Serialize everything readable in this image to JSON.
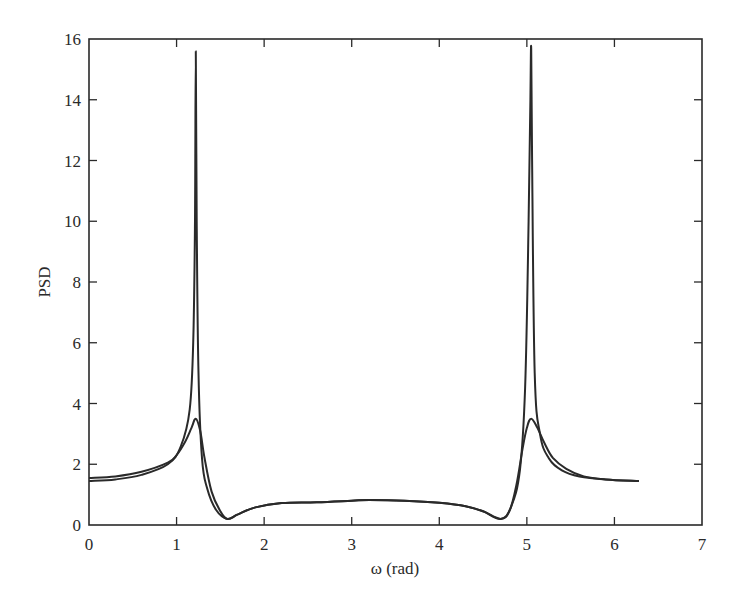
{
  "chart_data": {
    "type": "line",
    "title": "",
    "xlabel": "ω (rad)",
    "ylabel": "PSD",
    "xlim": [
      0,
      7
    ],
    "ylim": [
      0,
      16
    ],
    "xticks": [
      0,
      1,
      2,
      3,
      4,
      5,
      6,
      7
    ],
    "yticks": [
      0,
      2,
      4,
      6,
      8,
      10,
      12,
      14,
      16
    ],
    "xtick_labels": [
      "0",
      "1",
      "2",
      "3",
      "4",
      "5",
      "6",
      "7"
    ],
    "ytick_labels": [
      "0",
      "2",
      "4",
      "6",
      "8",
      "10",
      "12",
      "14",
      "16"
    ],
    "grid": false,
    "legend": null,
    "line_color": "#2a2a2a",
    "series": [
      {
        "name": "sharp-peak PSD",
        "x": [
          0,
          0.3,
          0.6,
          0.9,
          1.05,
          1.15,
          1.19,
          1.21,
          1.22,
          1.23,
          1.25,
          1.29,
          1.35,
          1.45,
          1.58,
          1.7,
          1.9,
          2.2,
          2.6,
          3.0,
          3.2,
          3.6,
          4.0,
          4.3,
          4.5,
          4.7,
          4.82,
          4.92,
          4.98,
          5.02,
          5.04,
          5.05,
          5.06,
          5.09,
          5.15,
          5.25,
          5.4,
          5.6,
          5.9,
          6.28
        ],
        "y": [
          1.45,
          1.5,
          1.65,
          2.0,
          2.6,
          3.8,
          6.0,
          10.0,
          15.6,
          10.0,
          5.0,
          2.2,
          1.2,
          0.5,
          0.2,
          0.35,
          0.58,
          0.72,
          0.75,
          0.8,
          0.82,
          0.8,
          0.73,
          0.62,
          0.45,
          0.2,
          0.6,
          1.8,
          4.5,
          10.0,
          14.0,
          15.7,
          12.0,
          5.0,
          3.0,
          2.2,
          1.8,
          1.6,
          1.5,
          1.45
        ]
      },
      {
        "name": "smoothed PSD",
        "x": [
          0,
          0.3,
          0.6,
          0.9,
          1.0,
          1.1,
          1.17,
          1.22,
          1.27,
          1.32,
          1.4,
          1.5,
          1.58,
          1.7,
          1.9,
          2.2,
          2.6,
          3.0,
          3.2,
          3.6,
          4.0,
          4.3,
          4.5,
          4.7,
          4.8,
          4.88,
          4.95,
          5.0,
          5.05,
          5.12,
          5.2,
          5.3,
          5.45,
          5.65,
          5.9,
          6.28
        ],
        "y": [
          1.55,
          1.6,
          1.75,
          2.05,
          2.3,
          2.75,
          3.2,
          3.5,
          3.1,
          2.2,
          1.1,
          0.45,
          0.2,
          0.35,
          0.58,
          0.72,
          0.75,
          0.8,
          0.82,
          0.8,
          0.73,
          0.62,
          0.45,
          0.2,
          0.45,
          1.3,
          2.5,
          3.2,
          3.5,
          3.2,
          2.7,
          2.2,
          1.85,
          1.6,
          1.5,
          1.45
        ]
      }
    ],
    "annotations": []
  }
}
